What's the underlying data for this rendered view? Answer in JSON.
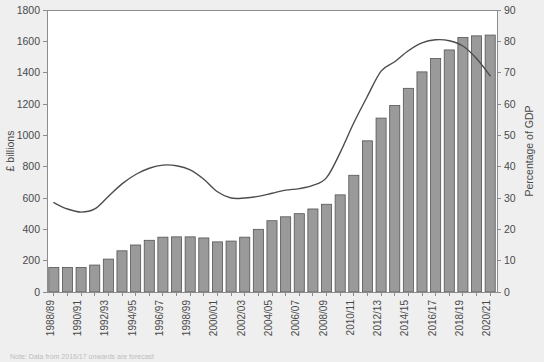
{
  "chart_data": {
    "type": "bar",
    "title": "",
    "subtitle": "",
    "xlabel": "",
    "ylabel": "£ billions",
    "y2label": "Percentage of GDP",
    "ylim": [
      0,
      1800
    ],
    "y2lim": [
      0,
      90
    ],
    "yticks": [
      0,
      200,
      400,
      600,
      800,
      1000,
      1200,
      1400,
      1600,
      1800
    ],
    "y2ticks": [
      0,
      10,
      20,
      30,
      40,
      50,
      60,
      70,
      80,
      90
    ],
    "grid": false,
    "legend_position": "none",
    "categories": [
      "1988/89",
      "1989/90",
      "1990/91",
      "1991/92",
      "1992/93",
      "1993/94",
      "1994/95",
      "1995/96",
      "1996/97",
      "1997/98",
      "1998/99",
      "1999/00",
      "2000/01",
      "2001/02",
      "2002/03",
      "2003/04",
      "2004/05",
      "2005/06",
      "2006/07",
      "2007/08",
      "2008/09",
      "2009/10",
      "2010/11",
      "2011/12",
      "2012/13",
      "2013/14",
      "2014/15",
      "2015/16",
      "2016/17",
      "2017/18",
      "2018/19",
      "2019/20",
      "2020/21"
    ],
    "xtick_labels": [
      "1988/89",
      "",
      "1990/91",
      "",
      "1992/93",
      "",
      "1994/95",
      "",
      "1996/97",
      "",
      "1998/99",
      "",
      "2000/01",
      "",
      "2002/03",
      "",
      "2004/05",
      "",
      "2006/07",
      "",
      "2008/09",
      "",
      "2010/11",
      "",
      "2012/13",
      "",
      "2014/15",
      "",
      "2016/17",
      "",
      "2018/19",
      "",
      "2020/21"
    ],
    "series": [
      {
        "name": "Public sector net debt",
        "unit": "£ billions",
        "axis": "left",
        "type": "bar",
        "color": "#9a9a9a",
        "values": [
          157,
          157,
          157,
          172,
          210,
          263,
          300,
          330,
          350,
          352,
          352,
          345,
          320,
          325,
          350,
          400,
          455,
          480,
          500,
          530,
          560,
          620,
          745,
          965,
          1110,
          1190,
          1300,
          1405,
          1490,
          1545,
          1625,
          1635,
          1640
        ]
      },
      {
        "name": "Public sector net debt as percentage of GDP",
        "unit": "Percentage of GDP",
        "axis": "right",
        "type": "line",
        "color": "#4d4d4d",
        "values": [
          28.5,
          26.5,
          25.5,
          26.5,
          30.5,
          34.5,
          37.5,
          39.5,
          40.5,
          40.3,
          39.0,
          36.0,
          32.0,
          30.0,
          30.0,
          30.5,
          31.5,
          32.5,
          33.0,
          34.0,
          36.5,
          44.5,
          54.0,
          62.5,
          70.5,
          73.5,
          77.0,
          79.5,
          80.5,
          80.2,
          78.5,
          74.5,
          69.0
        ]
      }
    ]
  },
  "footnote": {
    "text": "Note: Data from 2016/17 onwards are forecast"
  },
  "axes": {
    "left_title": "£ billions",
    "right_title": "Percentage of GDP"
  }
}
